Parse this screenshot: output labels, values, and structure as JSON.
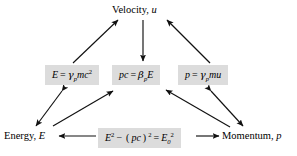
{
  "diagram": {
    "title_node": "Velocity, u",
    "type": "relativity-relations-flow",
    "background_color": "#ffffff",
    "box_fill_color": "#dcdcdc",
    "text_color": "#000000",
    "nodes": [
      {
        "id": "velocity",
        "label": "Velocity, u",
        "style": "plain",
        "parts": {
          "word": "Velocity,",
          "symbol": "u"
        }
      },
      {
        "id": "emc2",
        "label": "E = γp mc²",
        "style": "boxed",
        "parts": {
          "lhs": "E",
          "eq": "=",
          "gamma": "γ",
          "sub": "p",
          "rest": "mc",
          "exp": "2"
        }
      },
      {
        "id": "pcbetae",
        "label": "pc = βp E",
        "style": "boxed",
        "parts": {
          "lhs": "pc",
          "eq": "=",
          "beta": "β",
          "sub": "p",
          "rest": "E"
        }
      },
      {
        "id": "pgammamu",
        "label": "p = γp mu",
        "style": "boxed",
        "parts": {
          "lhs": "p",
          "eq": "=",
          "gamma": "γ",
          "sub": "p",
          "rest": "mu"
        }
      },
      {
        "id": "energy",
        "label": "Energy, E",
        "style": "plain",
        "parts": {
          "word": "Energy,",
          "symbol": "E"
        }
      },
      {
        "id": "invariant",
        "label": "E² − (pc)² = E₀²",
        "style": "boxed",
        "parts": {
          "e": "E",
          "e_exp": "2",
          "minus": "−",
          "paren_open": "(",
          "pc": "pc",
          "paren_close": ")",
          "pc_exp": "2",
          "eq": "=",
          "e0": "E",
          "e0_sub": "0",
          "e0_exp": "2"
        }
      },
      {
        "id": "momentum",
        "label": "Momentum, p",
        "style": "plain",
        "parts": {
          "word": "Momentum,",
          "symbol": "p"
        }
      }
    ],
    "edges": [
      {
        "from": "emc2",
        "to": "velocity",
        "heads": "single",
        "direction": "up-right"
      },
      {
        "from": "velocity",
        "to": "pcbetae",
        "heads": "single",
        "direction": "down"
      },
      {
        "from": "pgammamu",
        "to": "velocity",
        "heads": "single",
        "direction": "up-left"
      },
      {
        "from": "emc2",
        "to": "energy",
        "heads": "double",
        "direction": "down-left"
      },
      {
        "from": "energy",
        "to": "pcbetae",
        "heads": "single",
        "direction": "up-right"
      },
      {
        "from": "momentum",
        "to": "pcbetae",
        "heads": "single",
        "direction": "up-left"
      },
      {
        "from": "pgammamu",
        "to": "momentum",
        "heads": "double",
        "direction": "down-right"
      },
      {
        "from": "invariant",
        "to": "energy",
        "heads": "single",
        "direction": "left"
      },
      {
        "from": "invariant",
        "to": "momentum",
        "heads": "single",
        "direction": "right"
      }
    ]
  }
}
